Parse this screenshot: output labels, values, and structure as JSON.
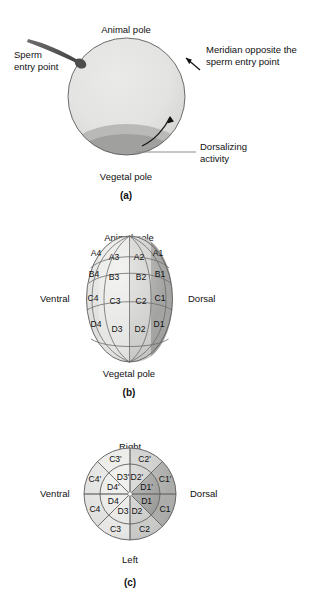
{
  "figure": {
    "title_visible": false,
    "background": "#ffffff"
  },
  "palette": {
    "cell_light": "#e6e6e4",
    "cell_light2": "#dededc",
    "cell_mid": "#c9c9c7",
    "cell_dark": "#a8a8a6",
    "cell_darker": "#949492",
    "egg_body": "#e2e2e0",
    "egg_band_mid": "#b9b9b7",
    "egg_band_dark": "#a0a09e",
    "sperm": "#4d4d4d",
    "outline": "#5e5e5e",
    "leader": "#8c8c8c",
    "text": "#111111"
  },
  "panel_a": {
    "caption": "(a)",
    "labels": {
      "animal_pole": "Animal pole",
      "vegetal_pole": "Vegetal pole",
      "sperm_entry_line1": "Sperm",
      "sperm_entry_line2": "entry point",
      "meridian_line1": "Meridian opposite the",
      "meridian_line2": "sperm entry  point",
      "dorsalizing_line1": "Dorsalizing",
      "dorsalizing_line2": "activity"
    },
    "geometry": {
      "cx": 126.5,
      "cy": 96.5,
      "r": 58.5,
      "band_mid_y": 126,
      "band_dark_y": 136
    }
  },
  "panel_b": {
    "caption": "(b)",
    "labels": {
      "animal_pole": "Animal pole",
      "vegetal_pole": "Vegetal pole",
      "ventral": "Ventral",
      "dorsal": "Dorsal"
    },
    "geometry": {
      "cx": 129.5,
      "cy": 299,
      "rx": 43,
      "ry": 63
    },
    "columns": [
      {
        "name": "1",
        "shade": "cell_darker"
      },
      {
        "name": "2",
        "shade": "cell_mid"
      },
      {
        "name": "3",
        "shade": "cell_light"
      },
      {
        "name": "4",
        "shade": "cell_light2"
      }
    ],
    "rows": [
      "A",
      "B",
      "C",
      "D"
    ],
    "cells": [
      {
        "label": "A4",
        "x": 96,
        "y": 256,
        "shade": "cell_light2"
      },
      {
        "label": "A3",
        "x": 114,
        "y": 260,
        "shade": "cell_light"
      },
      {
        "label": "A2",
        "x": 139,
        "y": 260,
        "shade": "cell_light"
      },
      {
        "label": "A1",
        "x": 158,
        "y": 256,
        "shade": "cell_dark"
      },
      {
        "label": "B4",
        "x": 94,
        "y": 277,
        "shade": "cell_light2"
      },
      {
        "label": "B3",
        "x": 114,
        "y": 280,
        "shade": "cell_light"
      },
      {
        "label": "B2",
        "x": 141,
        "y": 280,
        "shade": "cell_light"
      },
      {
        "label": "B1",
        "x": 160,
        "y": 277,
        "shade": "cell_darker"
      },
      {
        "label": "C4",
        "x": 93,
        "y": 301,
        "shade": "cell_light2"
      },
      {
        "label": "C3",
        "x": 115,
        "y": 304,
        "shade": "cell_light"
      },
      {
        "label": "C2",
        "x": 141,
        "y": 304,
        "shade": "cell_mid"
      },
      {
        "label": "C1",
        "x": 160,
        "y": 301,
        "shade": "cell_darker"
      },
      {
        "label": "D4",
        "x": 96,
        "y": 327,
        "shade": "cell_light2"
      },
      {
        "label": "D3",
        "x": 117,
        "y": 332,
        "shade": "cell_light"
      },
      {
        "label": "D2",
        "x": 140,
        "y": 332,
        "shade": "cell_mid"
      },
      {
        "label": "D1",
        "x": 159,
        "y": 327,
        "shade": "cell_darker"
      }
    ]
  },
  "panel_c": {
    "caption": "(c)",
    "labels": {
      "right": "Right",
      "left": "Left",
      "ventral": "Ventral",
      "dorsal": "Dorsal"
    },
    "geometry": {
      "cx": 130,
      "cy": 494,
      "r_outer": 46,
      "r_inner": 30
    },
    "sectors": [
      {
        "label": "D1'",
        "ring": "inner",
        "angle_start": -45,
        "angle_end": 0,
        "shade": "cell_darker"
      },
      {
        "label": "D2'",
        "ring": "inner",
        "angle_start": -90,
        "angle_end": -45,
        "shade": "cell_mid"
      },
      {
        "label": "D3'",
        "ring": "inner",
        "angle_start": -135,
        "angle_end": -90,
        "shade": "cell_light"
      },
      {
        "label": "D4'",
        "ring": "inner",
        "angle_start": -180,
        "angle_end": -135,
        "shade": "cell_light"
      },
      {
        "label": "D4",
        "ring": "inner",
        "angle_start": 135,
        "angle_end": 180,
        "shade": "cell_light"
      },
      {
        "label": "D3",
        "ring": "inner",
        "angle_start": 90,
        "angle_end": 135,
        "shade": "cell_light"
      },
      {
        "label": "D2",
        "ring": "inner",
        "angle_start": 45,
        "angle_end": 90,
        "shade": "cell_mid"
      },
      {
        "label": "D1",
        "ring": "inner",
        "angle_start": 0,
        "angle_end": 45,
        "shade": "cell_darker"
      },
      {
        "label": "C1'",
        "ring": "outer",
        "angle_start": -45,
        "angle_end": 0,
        "shade": "cell_dark"
      },
      {
        "label": "C2'",
        "ring": "outer",
        "angle_start": -90,
        "angle_end": -45,
        "shade": "cell_mid"
      },
      {
        "label": "C3'",
        "ring": "outer",
        "angle_start": -135,
        "angle_end": -90,
        "shade": "cell_light"
      },
      {
        "label": "C4'",
        "ring": "outer",
        "angle_start": -180,
        "angle_end": -135,
        "shade": "cell_light2"
      },
      {
        "label": "C4",
        "ring": "outer",
        "angle_start": 135,
        "angle_end": 180,
        "shade": "cell_light2"
      },
      {
        "label": "C3",
        "ring": "outer",
        "angle_start": 90,
        "angle_end": 135,
        "shade": "cell_light"
      },
      {
        "label": "C2",
        "ring": "outer",
        "angle_start": 45,
        "angle_end": 90,
        "shade": "cell_mid"
      },
      {
        "label": "C1",
        "ring": "outer",
        "angle_start": 0,
        "angle_end": 45,
        "shade": "cell_dark"
      }
    ]
  }
}
